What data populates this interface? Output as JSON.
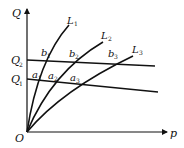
{
  "diagram": {
    "axes": {
      "y_label": "Q",
      "x_label": "p",
      "origin_label": "O"
    },
    "horizontal_lines": [
      {
        "label": "Q",
        "sub": "2",
        "points": [
          "b",
          "b",
          "b"
        ]
      },
      {
        "label": "Q",
        "sub": "1",
        "points": [
          "a",
          "a",
          "a"
        ]
      }
    ],
    "curves": [
      {
        "label": "L",
        "sub": "1"
      },
      {
        "label": "L",
        "sub": "2"
      },
      {
        "label": "L",
        "sub": "3"
      }
    ],
    "intersections": {
      "b1": {
        "label": "b",
        "sub": "1"
      },
      "b2": {
        "label": "b",
        "sub": "2"
      },
      "b3": {
        "label": "b",
        "sub": "3"
      },
      "a1": {
        "label": "a",
        "sub": "1"
      },
      "a2": {
        "label": "a",
        "sub": "2"
      },
      "a3": {
        "label": "a",
        "sub": "3"
      }
    },
    "colors": {
      "stroke": "#111111",
      "background": "#ffffff"
    }
  }
}
